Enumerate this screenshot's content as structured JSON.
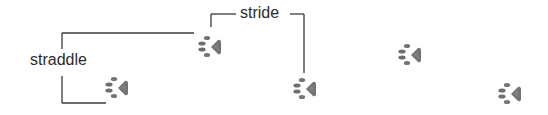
{
  "diagram": {
    "labels": {
      "stride": "stride",
      "straddle": "straddle"
    },
    "colors": {
      "line": "#3a3a3a",
      "text": "#2b2b2b",
      "paw_toe": "#707070",
      "paw_pad": "#666666",
      "background": "#ffffff"
    },
    "paw_prints": [
      {
        "id": 1,
        "cx": 210,
        "cy": 47,
        "icon": "paw-print-icon"
      },
      {
        "id": 2,
        "cx": 117,
        "cy": 88,
        "icon": "paw-print-icon"
      },
      {
        "id": 3,
        "cx": 305,
        "cy": 89,
        "icon": "paw-print-icon"
      },
      {
        "id": 4,
        "cx": 410,
        "cy": 55,
        "icon": "paw-print-icon"
      },
      {
        "id": 5,
        "cx": 510,
        "cy": 94,
        "icon": "paw-print-icon"
      }
    ],
    "brackets": {
      "stride": {
        "description": "horizontal distance between successive prints on the same side"
      },
      "straddle": {
        "description": "lateral width between left and right print lines"
      }
    }
  }
}
